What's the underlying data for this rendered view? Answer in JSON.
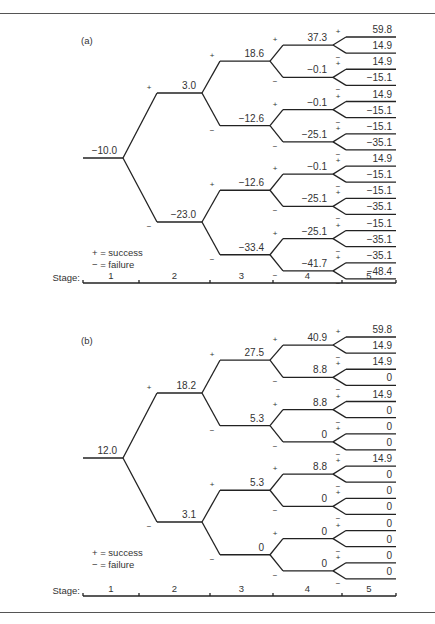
{
  "figure": {
    "legend": {
      "plus": "+ = success",
      "minus": "− = failure"
    },
    "stage_label": "Stage:",
    "stages": [
      "1",
      "2",
      "3",
      "4",
      "5"
    ],
    "sign_plus": "+",
    "sign_minus": "−"
  },
  "chart_data": [
    {
      "type": "tree",
      "title": "(a)",
      "description": "Binary decision tree over 5 stages; + = success, − = failure",
      "stage1": [
        "−10.0"
      ],
      "stage2": [
        "3.0",
        "−23.0"
      ],
      "stage3": [
        "18.6",
        "−12.6",
        "−12.6",
        "−33.4"
      ],
      "stage4": [
        "37.3",
        "−0.1",
        "−0.1",
        "−25.1",
        "−0.1",
        "−25.1",
        "−25.1",
        "−41.7"
      ],
      "stage5": [
        "59.8",
        "14.9",
        "14.9",
        "−15.1",
        "14.9",
        "−15.1",
        "−15.1",
        "−35.1",
        "14.9",
        "−15.1",
        "−15.1",
        "−35.1",
        "−15.1",
        "−35.1",
        "−35.1",
        "−48.4"
      ]
    },
    {
      "type": "tree",
      "title": "(b)",
      "description": "Binary decision tree over 5 stages; + = success, − = failure",
      "stage1": [
        "12.0"
      ],
      "stage2": [
        "18.2",
        "3.1"
      ],
      "stage3": [
        "27.5",
        "5.3",
        "5.3",
        "0"
      ],
      "stage4": [
        "40.9",
        "8.8",
        "8.8",
        "0",
        "8.8",
        "0",
        "0",
        "0"
      ],
      "stage5": [
        "59.8",
        "14.9",
        "14.9",
        "0",
        "14.9",
        "0",
        "0",
        "0",
        "14.9",
        "0",
        "0",
        "0",
        "0",
        "0",
        "0",
        "0"
      ]
    }
  ]
}
